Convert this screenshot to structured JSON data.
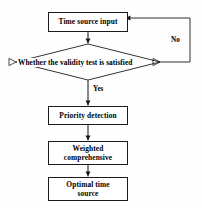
{
  "diagram": {
    "type": "flowchart",
    "background_color": "#fefefe",
    "line_color": "#1a1a1a",
    "text_color": "#000000",
    "nodes": [
      {
        "id": "time-source-input",
        "shape": "rectangle",
        "label": "Time source input"
      },
      {
        "id": "validity-test",
        "shape": "diamond",
        "label": "Whether the validity test is satisfied"
      },
      {
        "id": "priority-detection",
        "shape": "rectangle",
        "label": "Priority detection"
      },
      {
        "id": "weighted-comprehensive",
        "shape": "rectangle",
        "label_line1": "Weighted",
        "label_line2": "comprehensive"
      },
      {
        "id": "optimal-time-source",
        "shape": "rectangle",
        "label_line1": "Optimal time",
        "label_line2": "source"
      }
    ],
    "edge_labels": {
      "no": "No",
      "yes": "Yes"
    }
  }
}
